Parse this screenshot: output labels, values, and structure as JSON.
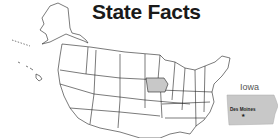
{
  "title": "State Facts",
  "map": {
    "highlighted_state": "Iowa",
    "highlight_color": "#c8c8c8",
    "outline_color": "#222222"
  },
  "inset": {
    "state_name": "Iowa",
    "capital": "Des Moines",
    "capital_marker": "★",
    "fill_color": "#c8c8c8"
  }
}
